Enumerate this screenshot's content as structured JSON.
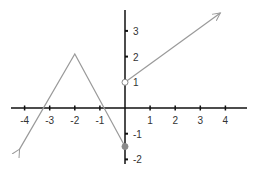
{
  "chart_data": {
    "type": "line",
    "title": "",
    "xlabel": "",
    "ylabel": "",
    "xlim": [
      -4.5,
      4.9
    ],
    "ylim": [
      -2.2,
      3.8
    ],
    "grid": false,
    "x_ticks": [
      -4,
      -3,
      -2,
      -1,
      1,
      2,
      3,
      4
    ],
    "x_tick_labels": [
      "-4",
      "-3",
      "-2",
      "-1",
      "1",
      "2",
      "3",
      "4"
    ],
    "y_ticks": [
      3,
      2,
      1,
      -1,
      -2
    ],
    "y_tick_labels": [
      "3",
      "2",
      "1",
      "-1",
      "-2"
    ],
    "series": [
      {
        "name": "left piece",
        "points": [
          [
            -4.2,
            -1.6
          ],
          [
            -2,
            2.1
          ],
          [
            0,
            -1.5
          ]
        ],
        "start": "arrow",
        "end": "closed-dot",
        "color": "#9a9a9a"
      },
      {
        "name": "right piece",
        "points": [
          [
            0,
            1
          ],
          [
            3.8,
            3.7
          ]
        ],
        "start": "open-circle",
        "end": "arrow",
        "color": "#9a9a9a"
      }
    ],
    "annotations": [
      {
        "type": "open-circle",
        "x": 0,
        "y": 1
      },
      {
        "type": "closed-dot",
        "x": 0,
        "y": -1.5
      }
    ]
  },
  "colors": {
    "axis": "#111111",
    "curve": "#9a9a9a",
    "label": "#333333"
  }
}
